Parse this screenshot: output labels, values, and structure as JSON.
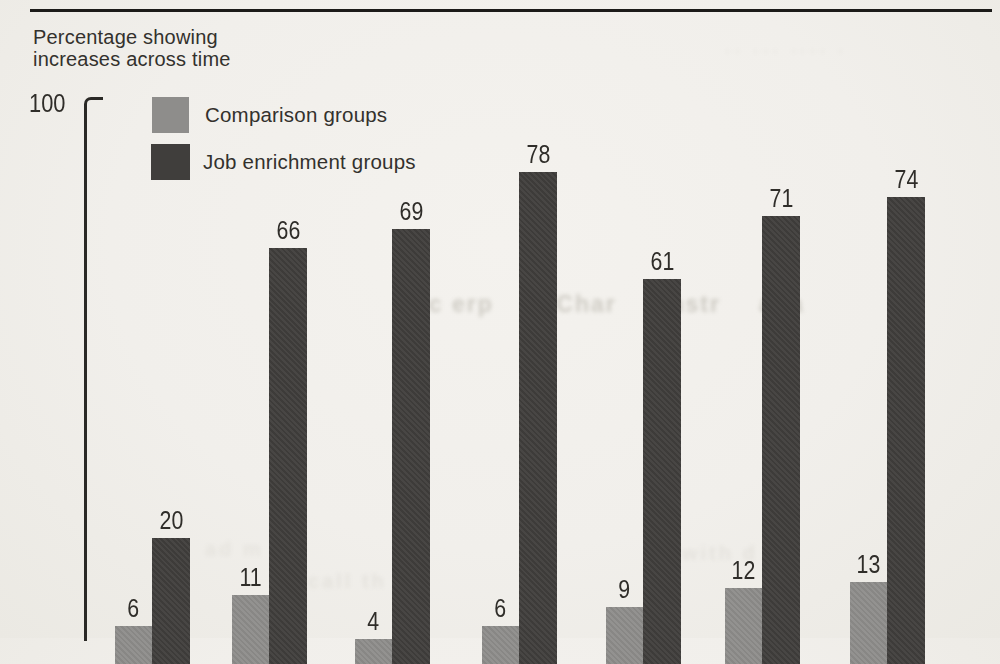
{
  "title": {
    "line1": "Percentage showing",
    "line2": "increases across time"
  },
  "y_axis": {
    "top_tick_label": "100"
  },
  "legend": {
    "comparison": {
      "label": "Comparison groups",
      "color": "#8e8d8b"
    },
    "enrichment": {
      "label": "Job enrichment groups",
      "color": "#403e3c"
    }
  },
  "chart_data": {
    "type": "bar",
    "title": "Percentage showing increases across time",
    "series": [
      {
        "name": "Comparison groups",
        "color": "#8e8d8b",
        "values": [
          6,
          11,
          4,
          6,
          9,
          12,
          13
        ]
      },
      {
        "name": "Job enrichment groups",
        "color": "#403e3c",
        "values": [
          20,
          66,
          69,
          78,
          61,
          71,
          74
        ]
      }
    ],
    "pair_count": 7,
    "ylim": [
      0,
      100
    ],
    "y_tick_labels": [
      "100"
    ],
    "x_tick_labels_visible": false,
    "grid": false,
    "legend_position": "top-left-inside",
    "note": "chart baseline and x-axis category labels are cut off at the bottom edge of the scanned page"
  },
  "ghost_bleedthrough": {
    "mid_fragments": [
      "agc erp",
      "b Char",
      "anstr",
      "aga"
    ],
    "bottom_left_fragment": "ad m",
    "bottom_mid_fragment": "call th",
    "bottom_right_fragment": "with d",
    "top_right_fragment": "·· ···  ···· ·"
  }
}
